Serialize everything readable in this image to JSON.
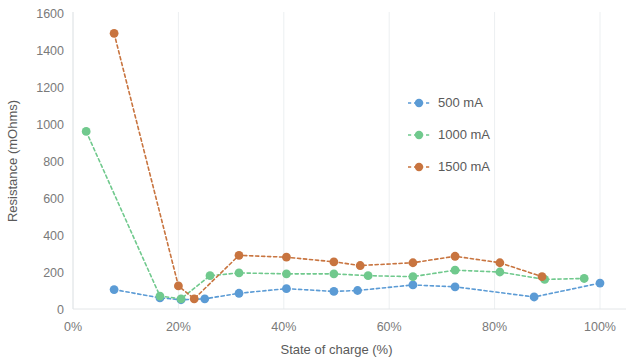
{
  "chart_data": {
    "type": "line",
    "title": "",
    "xlabel": "State of charge (%)",
    "ylabel": "Resistance (mOhms)",
    "xlim": [
      0,
      100
    ],
    "ylim": [
      0,
      1600
    ],
    "xticks": [
      "0%",
      "20%",
      "40%",
      "60%",
      "80%",
      "100%"
    ],
    "xtick_values": [
      0,
      20,
      40,
      60,
      80,
      100
    ],
    "yticks": [
      "0",
      "200",
      "400",
      "600",
      "800",
      "1000",
      "1200",
      "1400",
      "1600"
    ],
    "ytick_values": [
      0,
      200,
      400,
      600,
      800,
      1000,
      1200,
      1400,
      1600
    ],
    "grid": false,
    "legend_position": "upper right",
    "marker": "circle",
    "linestyle": "dashed",
    "series": [
      {
        "name": "500 mA",
        "color": "#5B9BD5",
        "x": [
          7.8,
          16.5,
          20.5,
          25.0,
          31.5,
          40.5,
          49.5,
          54.0,
          64.5,
          72.5,
          87.5,
          100.0
        ],
        "y": [
          105,
          60,
          50,
          55,
          85,
          110,
          95,
          100,
          130,
          120,
          65,
          140
        ]
      },
      {
        "name": "1000 mA",
        "color": "#70C98D",
        "x": [
          2.5,
          16.5,
          20.5,
          26.0,
          31.5,
          40.5,
          49.5,
          56.0,
          64.5,
          72.5,
          81.0,
          89.5,
          97.0
        ],
        "y": [
          960,
          70,
          55,
          180,
          195,
          190,
          190,
          180,
          175,
          210,
          200,
          160,
          165
        ]
      },
      {
        "name": "1500 mA",
        "color": "#C8743F",
        "x": [
          7.8,
          20.0,
          23.0,
          31.5,
          40.5,
          49.5,
          54.5,
          64.5,
          72.5,
          81.0,
          89.0
        ],
        "y": [
          1490,
          125,
          55,
          290,
          280,
          255,
          235,
          250,
          285,
          250,
          175
        ]
      }
    ]
  },
  "legend": {
    "items": [
      {
        "label": "500 mA",
        "color": "#5B9BD5"
      },
      {
        "label": "1000 mA",
        "color": "#70C98D"
      },
      {
        "label": "1500 mA",
        "color": "#C8743F"
      }
    ]
  }
}
